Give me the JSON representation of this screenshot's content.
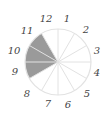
{
  "diagram": {
    "type": "fraction-circle",
    "total_sectors": 12,
    "shaded_sectors": 3,
    "labels": [
      "12",
      "1",
      "2",
      "3",
      "4",
      "5",
      "6",
      "7",
      "8",
      "9",
      "10",
      "11"
    ],
    "shaded_color": "#9a9a9a",
    "line_color": "#e2e2e2",
    "label_color": "#444444"
  }
}
